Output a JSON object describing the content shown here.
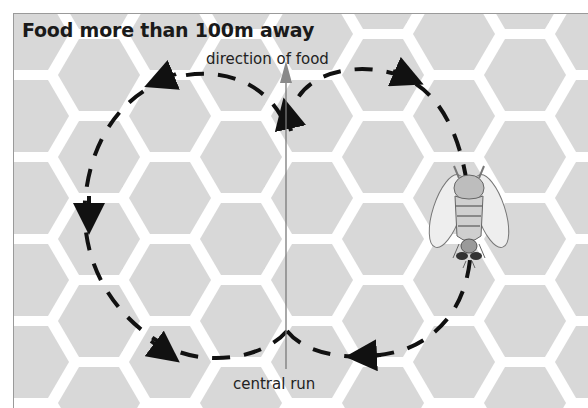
{
  "diagram": {
    "title": "Food more than 100m away",
    "labels": {
      "direction": "direction of food",
      "central_run": "central run"
    },
    "elements": [
      {
        "id": "honeycomb-background",
        "type": "hexagon-grid"
      },
      {
        "id": "left-loop",
        "type": "dashed-circular-path",
        "direction": "counter-clockwise"
      },
      {
        "id": "right-loop",
        "type": "dashed-circular-path",
        "direction": "clockwise"
      },
      {
        "id": "central-run-line",
        "type": "vertical-arrow-line"
      },
      {
        "id": "bee",
        "type": "illustration"
      }
    ],
    "colors": {
      "background": "#d8d8d8",
      "hex_gap": "#ffffff",
      "path": "#111111",
      "direction_arrow": "#8a8a8a"
    }
  }
}
